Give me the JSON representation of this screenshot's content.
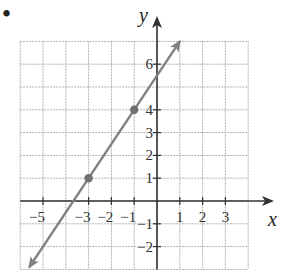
{
  "problem_marker": "•",
  "chart_data": {
    "type": "line",
    "title": "",
    "xlabel": "x",
    "ylabel": "y",
    "xlim": [
      -6,
      4
    ],
    "ylim": [
      -3,
      7
    ],
    "grid": true,
    "x_tick_labels": [
      "-5",
      "-3",
      "-2",
      "-1",
      "1",
      "2",
      "3"
    ],
    "x_ticks": [
      -5,
      -3,
      -2,
      -1,
      1,
      2,
      3
    ],
    "y_tick_labels": [
      "6",
      "4",
      "3",
      "2",
      "1",
      "-1",
      "-2"
    ],
    "y_ticks": [
      6,
      4,
      3,
      2,
      1,
      -1,
      -2
    ],
    "series": [
      {
        "name": "line",
        "equation": "y = 1.5x + 5.5",
        "points": [
          {
            "x": -3,
            "y": 1
          },
          {
            "x": -1,
            "y": 4
          }
        ],
        "x": [
          -5.6,
          1.0
        ],
        "y": [
          -2.9,
          7.0
        ],
        "arrows": "both",
        "color": "#808080"
      }
    ]
  },
  "colors": {
    "grid": "#b0b0b0",
    "axis": "#333333",
    "line": "#808080",
    "point": "#707070"
  }
}
